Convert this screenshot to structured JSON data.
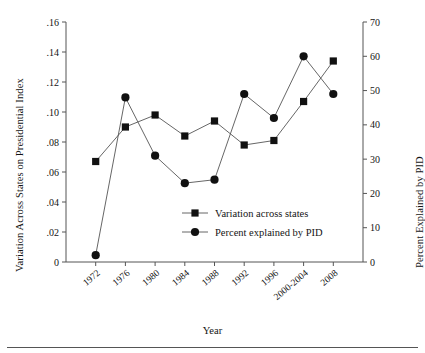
{
  "chart_data": {
    "type": "line",
    "title": "",
    "xlabel": "Year",
    "ylabel": "Variation Across States on Presidential Index",
    "ylabel_right": "Percent Explained by PID",
    "categories": [
      "1972",
      "1976",
      "1980",
      "1984",
      "1988",
      "1992",
      "1996",
      "2000-2004",
      "2008"
    ],
    "x_tick_labels": [
      "1972",
      "1976",
      "1980",
      "1984",
      "1988",
      "1992",
      "1996",
      "2000-2004",
      "2008"
    ],
    "y_tick_labels_left": [
      "0",
      ".02",
      ".04",
      ".06",
      ".08",
      ".10",
      ".12",
      ".14",
      ".16"
    ],
    "y_tick_labels_right": [
      "0",
      "10",
      "20",
      "30",
      "40",
      "50",
      "60",
      "70"
    ],
    "ylim": [
      0,
      0.16
    ],
    "ylim_right": [
      0,
      70
    ],
    "grid": false,
    "legend_position": "inside-lower-center",
    "series": [
      {
        "name": "Variation across states",
        "axis": "left",
        "marker": "square",
        "values": [
          0.067,
          0.09,
          0.098,
          0.084,
          0.094,
          0.078,
          0.081,
          0.107,
          0.134
        ]
      },
      {
        "name": "Percent explained by PID",
        "axis": "right",
        "marker": "circle",
        "values": [
          2,
          48,
          31,
          23,
          24,
          49,
          42,
          60,
          49
        ]
      }
    ],
    "colors": {
      "line": "#555555",
      "marker": "#111111",
      "axis": "#555555"
    }
  },
  "legend": {
    "entries": [
      {
        "label": "Variation across states",
        "marker": "square"
      },
      {
        "label": "Percent explained by PID",
        "marker": "circle"
      }
    ]
  }
}
